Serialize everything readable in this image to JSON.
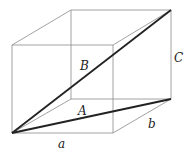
{
  "diagram": {
    "labels": {
      "a": "a",
      "b": "b",
      "C": "C",
      "A": "A",
      "B": "B"
    },
    "colors": {
      "edge": "#8a8a8a",
      "diagonal": "#222222",
      "background": "#ffffff"
    }
  }
}
